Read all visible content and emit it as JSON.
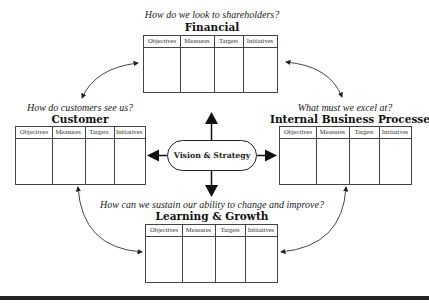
{
  "diagram": {
    "center": {
      "label": "Vision & Strategy"
    },
    "columns": [
      "Objectives",
      "Measures",
      "Targets",
      "Initiatives"
    ],
    "perspectives": [
      {
        "id": "financial",
        "question": "How do we look to shareholders?",
        "title": "Financial"
      },
      {
        "id": "customer",
        "question": "How do customers see us?",
        "title": "Customer"
      },
      {
        "id": "internal",
        "question": "What must we excel at?",
        "title": "Internal Business Processes"
      },
      {
        "id": "learning",
        "question": "How can we sustain our ability to change and improve?",
        "title": "Learning & Growth"
      }
    ]
  }
}
